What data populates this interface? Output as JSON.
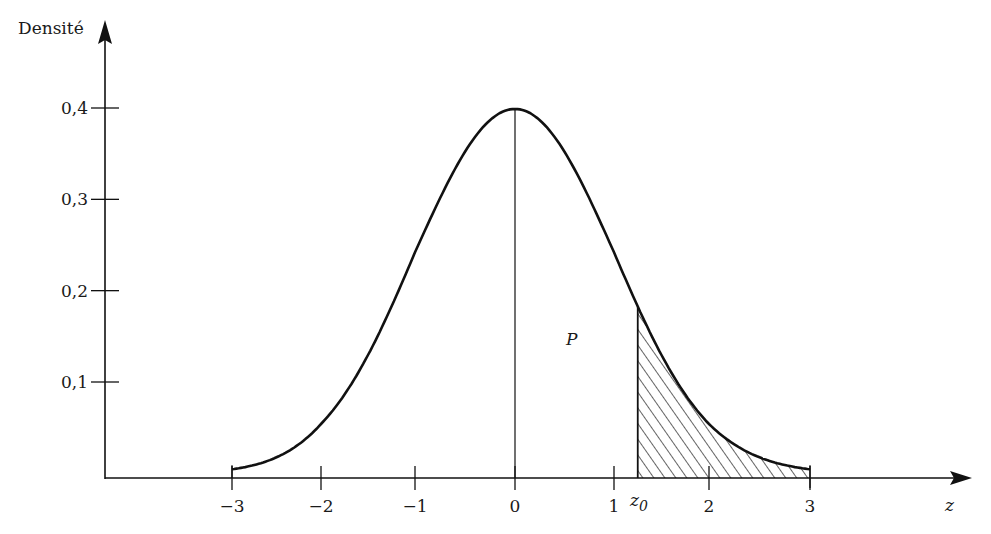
{
  "chart_data": {
    "type": "area",
    "title": "",
    "xlabel": "z",
    "ylabel": "Densité",
    "x_ticks": [
      {
        "value": -3,
        "label": "−3"
      },
      {
        "value": -2,
        "label": "−2"
      },
      {
        "value": -1,
        "label": "−1"
      },
      {
        "value": 0,
        "label": "0"
      },
      {
        "value": 1,
        "label": "1"
      },
      {
        "value": 2,
        "label": "2"
      },
      {
        "value": 3,
        "label": "3"
      }
    ],
    "y_ticks": [
      {
        "value": 0.1,
        "label": "0,1"
      },
      {
        "value": 0.2,
        "label": "0,2"
      },
      {
        "value": 0.3,
        "label": "0,3"
      },
      {
        "value": 0.4,
        "label": "0,4"
      }
    ],
    "xlim": [
      -3,
      3
    ],
    "ylim": [
      0,
      0.4
    ],
    "grid": false,
    "legend": null,
    "series": [
      {
        "name": "Standard normal density",
        "function": "exp(-z^2/2)/sqrt(2*pi)",
        "x": [
          -3,
          -2.5,
          -2,
          -1.5,
          -1,
          -0.5,
          0,
          0.5,
          1,
          1.5,
          2,
          2.5,
          3
        ],
        "values": [
          0.004,
          0.018,
          0.054,
          0.13,
          0.242,
          0.352,
          0.399,
          0.352,
          0.242,
          0.13,
          0.054,
          0.018,
          0.004
        ]
      }
    ],
    "shaded_region": {
      "from": "z0",
      "to": 3,
      "z0_approx": 1.25,
      "pattern": "diagonal-hatch"
    },
    "annotations": [
      {
        "text": "P",
        "x": 0.55,
        "y": 0.14,
        "style": "italic"
      },
      {
        "text": "z0",
        "x": 1.25,
        "position": "below-axis",
        "style": "italic-subscript"
      }
    ],
    "reference_lines": [
      {
        "type": "vertical",
        "x": 0,
        "to": "peak"
      }
    ]
  },
  "labels": {
    "y_axis_title": "Densité",
    "x_axis_title": "z",
    "p_label": "P",
    "z0_main": "z",
    "z0_sub": "0"
  },
  "style": {
    "ink": "#111111",
    "background": "#ffffff"
  }
}
